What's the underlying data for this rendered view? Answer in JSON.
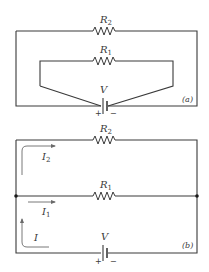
{
  "diagram_a": {
    "label": "(a)",
    "resistor_top": {
      "name": "R",
      "sub": "2"
    },
    "resistor_inner": {
      "name": "R",
      "sub": "1"
    },
    "battery": {
      "name": "V",
      "plus": "+",
      "minus": "−"
    }
  },
  "diagram_b": {
    "label": "(b)",
    "resistor_top": {
      "name": "R",
      "sub": "2"
    },
    "resistor_mid": {
      "name": "R",
      "sub": "1"
    },
    "battery": {
      "name": "V",
      "plus": "+",
      "minus": "−"
    },
    "currents": [
      {
        "name": "I",
        "sub": "2"
      },
      {
        "name": "I",
        "sub": "1"
      },
      {
        "name": "I",
        "sub": ""
      }
    ]
  },
  "colors": {
    "line": "#3a3a3a",
    "arrow": "#6a6a6a",
    "background": "#ffffff"
  }
}
